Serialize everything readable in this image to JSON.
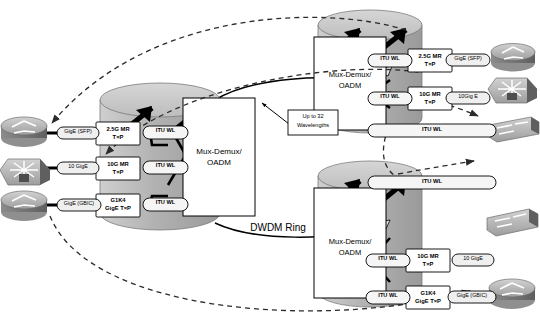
{
  "diagram": {
    "ring_label": "DWDM Ring",
    "callout": {
      "line1": "Up to 32",
      "line2": "Wavelengths"
    },
    "colors": {
      "node_body": "#b4b4b4",
      "node_top": "#c9c9c9",
      "node_shadow": "#8f8f8f",
      "panel_fill": "#ffffff",
      "stroke": "#000000",
      "device_light": "#c6c6c6",
      "device_mid": "#9a9a9a",
      "device_dark": "#6d6d6d",
      "pill_fill": "#f2f2f2"
    }
  },
  "nodes": [
    {
      "id": "node-west",
      "name": "Mux-Demux/OADM West",
      "mux_label_line1": "Mux-Demux/",
      "mux_label_line2": "OADM",
      "cards": [
        {
          "line1": "2.5G MR",
          "line2": "T×P",
          "itu": "ITU WL"
        },
        {
          "line1": "10G MR",
          "line2": "T×P",
          "itu": "ITU WL"
        },
        {
          "line1": "G1K4",
          "line2": "GigE T×P",
          "itu": "ITU WL"
        }
      ]
    },
    {
      "id": "node-northeast",
      "name": "Mux-Demux/OADM Northeast",
      "mux_label_line1": "Mux-Demux/",
      "mux_label_line2": "OADM",
      "cards": [
        {
          "line1": "2.5G MR",
          "line2": "T×P",
          "itu": "ITU WL",
          "client": "GigE (SFP)"
        },
        {
          "line1": "10G MR",
          "line2": "T×P",
          "itu": "ITU WL",
          "client": "10Gig E"
        }
      ],
      "through_bar": "ITU WL"
    },
    {
      "id": "node-southeast",
      "name": "Mux-Demux/OADM Southeast",
      "mux_label_line1": "Mux-Demux/",
      "mux_label_line2": "OADM",
      "through_bar": "ITU WL",
      "cards": [
        {
          "line1": "10G MR",
          "line2": "T×P",
          "itu": "ITU WL",
          "client": "10 GigE"
        },
        {
          "line1": "G1K4",
          "line2": "GigE T×P",
          "itu": "ITU WL",
          "client": "GigE (GBIC)"
        }
      ]
    }
  ],
  "client_links": {
    "west": [
      {
        "label": "GigE (SFP)",
        "device": "router"
      },
      {
        "label": "10 GigE",
        "device": "multilayer-switch"
      },
      {
        "label": "GigE (GBIC)",
        "device": "router"
      }
    ],
    "northeast": [
      {
        "label": "GigE (SFP)",
        "device": "router"
      },
      {
        "label": "10Gig E",
        "device": "multilayer-switch"
      },
      {
        "label": "",
        "device": "workgroup-switch"
      }
    ],
    "southeast": [
      {
        "label": "",
        "device": "workgroup-switch"
      },
      {
        "label": "10 GigE",
        "device": "multilayer-switch-hidden"
      },
      {
        "label": "GigE (GBIC)",
        "device": "router"
      }
    ]
  }
}
